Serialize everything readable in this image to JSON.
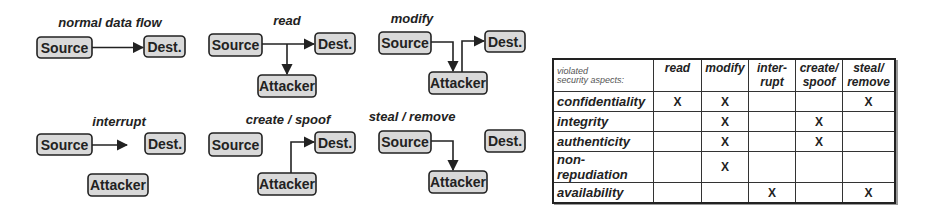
{
  "diagrams": [
    {
      "id": "normal",
      "title": "normal data flow",
      "source": "Source",
      "dest": "Dest."
    },
    {
      "id": "read",
      "title": "read",
      "source": "Source",
      "dest": "Dest.",
      "attacker": "Attacker"
    },
    {
      "id": "modify",
      "title": "modify",
      "source": "Source",
      "dest": "Dest.",
      "attacker": "Attacker"
    },
    {
      "id": "interrupt",
      "title": "interrupt",
      "source": "Source",
      "dest": "Dest.",
      "attacker": "Attacker"
    },
    {
      "id": "create",
      "title": "create / spoof",
      "source": "Source",
      "dest": "Dest.",
      "attacker": "Attacker"
    },
    {
      "id": "steal",
      "title": "steal / remove",
      "source": "Source",
      "dest": "Dest.",
      "attacker": "Attacker"
    }
  ],
  "table": {
    "corner_line1": "violated",
    "corner_line2": "security aspects:",
    "columns": [
      {
        "line1": "read",
        "line2": ""
      },
      {
        "line1": "modify",
        "line2": ""
      },
      {
        "line1": "inter-",
        "line2": "rupt"
      },
      {
        "line1": "create/",
        "line2": "spoof"
      },
      {
        "line1": "steal/",
        "line2": "remove"
      }
    ],
    "rows": [
      {
        "aspect": "confidentiality",
        "cells": [
          "X",
          "X",
          "",
          "",
          "X"
        ]
      },
      {
        "aspect": "integrity",
        "cells": [
          "",
          "X",
          "",
          "X",
          ""
        ]
      },
      {
        "aspect": "authenticity",
        "cells": [
          "",
          "X",
          "",
          "X",
          ""
        ]
      },
      {
        "aspect": "non-repudiation",
        "cells": [
          "",
          "X",
          "",
          "",
          ""
        ]
      },
      {
        "aspect": "availability",
        "cells": [
          "",
          "",
          "X",
          "",
          "X"
        ]
      }
    ]
  }
}
